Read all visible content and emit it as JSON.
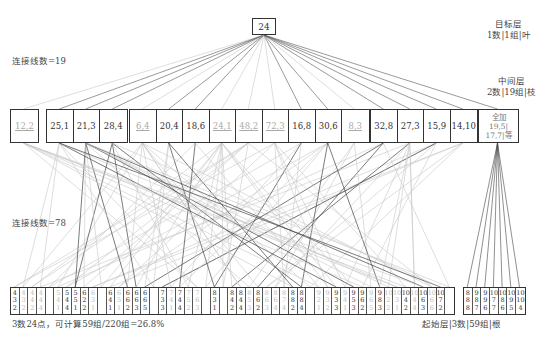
{
  "root": {
    "value": "24"
  },
  "labels": {
    "target_layer_title": "目标层",
    "target_layer_desc": "1数|1组|叶",
    "mid_layer_title": "中间层",
    "mid_layer_desc": "2数|19组|枝",
    "links_top": "连接线数=19",
    "links_bottom": "连接线数=78",
    "summary": "3数24点，可计算59组/220组=26.8%",
    "start_layer": "起始层|3数|59组|根"
  },
  "middle_groups": [
    {
      "left": 10,
      "cells": [
        {
          "text": "12,2",
          "faded": true
        }
      ]
    },
    {
      "left": 46,
      "cells": [
        {
          "text": "25,1"
        },
        {
          "text": "21,3"
        },
        {
          "text": "28,4"
        }
      ]
    },
    {
      "left": 129,
      "cells": [
        {
          "text": "6,4",
          "faded": true
        },
        {
          "text": "20,4"
        },
        {
          "text": "18,6"
        },
        {
          "text": "24,1",
          "faded": true
        },
        {
          "text": "48,2",
          "faded": true
        },
        {
          "text": "72,3",
          "faded": true
        },
        {
          "text": "16,8"
        },
        {
          "text": "30,6"
        },
        {
          "text": "8,3",
          "faded": true
        }
      ]
    },
    {
      "left": 370,
      "cells": [
        {
          "text": "32,8"
        },
        {
          "text": "27,3"
        },
        {
          "text": "15,9"
        },
        {
          "text": "14,10"
        }
      ]
    },
    {
      "left": 478,
      "cells": [
        {
          "note": true,
          "line1": "全加",
          "line2": "19,5|",
          "line3": "17,7|等"
        }
      ]
    }
  ],
  "bottom_cells": [
    {
      "d": [
        "4",
        "3",
        "2"
      ]
    },
    {
      "d": [
        "4",
        "3",
        "2"
      ],
      "faded": true
    },
    {
      "d": [
        "4",
        "4",
        "2"
      ],
      "faded": true
    },
    {
      "d": [
        "4",
        "4",
        "4"
      ],
      "faded": true
    },
    {
      "d": [
        "",
        "",
        ""
      ],
      "faded": true
    },
    {
      "d": [
        "5",
        "4",
        "1"
      ],
      "faded": true
    },
    {
      "d": [
        "5",
        "4",
        "4"
      ]
    },
    {
      "d": [
        "5",
        "5",
        "1"
      ]
    },
    {
      "d": [
        "6",
        "2",
        "2"
      ]
    },
    {
      "d": [
        "6",
        "3",
        "1"
      ],
      "faded": true
    },
    {
      "d": [
        "",
        "",
        ""
      ],
      "faded": true
    },
    {
      "d": [
        "6",
        "4",
        "1"
      ]
    },
    {
      "d": [
        "6",
        "5",
        "1"
      ],
      "faded": true
    },
    {
      "d": [
        "6",
        "6",
        "2"
      ]
    },
    {
      "d": [
        "6",
        "6",
        "3"
      ]
    },
    {
      "d": [
        "6",
        "6",
        "5"
      ]
    },
    {
      "d": [
        "",
        "",
        ""
      ],
      "faded": true
    },
    {
      "d": [
        "7",
        "3",
        "3"
      ]
    },
    {
      "d": [
        "7",
        "4",
        "1"
      ],
      "faded": true
    },
    {
      "d": [
        "7",
        "4",
        "4"
      ]
    },
    {
      "d": [
        "7",
        "5",
        "2"
      ],
      "faded": true
    },
    {
      "d": [
        "7",
        "6",
        "3"
      ],
      "faded": true
    },
    {
      "d": [
        "",
        "",
        ""
      ],
      "faded": true
    },
    {
      "d": [
        "8",
        "3",
        "1"
      ]
    },
    {
      "d": [
        "",
        "",
        ""
      ],
      "faded": true
    },
    {
      "d": [
        "8",
        "4",
        "2"
      ]
    },
    {
      "d": [
        "8",
        "4",
        "4"
      ]
    },
    {
      "d": [
        "8",
        "5",
        "3"
      ],
      "faded": true
    },
    {
      "d": [
        "8",
        "6",
        "2"
      ]
    },
    {
      "d": [
        "8",
        "6",
        "3"
      ],
      "faded": true
    },
    {
      "d": [
        "8",
        "6",
        "4"
      ],
      "faded": true
    },
    {
      "d": [
        "8",
        "7",
        "4"
      ],
      "faded": true
    },
    {
      "d": [
        "8",
        "8",
        "2"
      ]
    },
    {
      "d": [
        "8",
        "8",
        "4"
      ]
    },
    {
      "d": [
        "",
        "",
        ""
      ],
      "faded": true
    },
    {
      "d": [
        "9",
        "2",
        "1"
      ],
      "faded": true
    },
    {
      "d": [
        "9",
        "3",
        "2"
      ],
      "faded": true
    },
    {
      "d": [
        "9",
        "3",
        "3"
      ]
    },
    {
      "d": [
        "9",
        "4",
        "1"
      ],
      "faded": true
    },
    {
      "d": [
        "9",
        "5",
        "3"
      ]
    },
    {
      "d": [
        "9",
        "6",
        "2"
      ]
    },
    {
      "d": [
        "9",
        "6",
        "5"
      ],
      "faded": true
    },
    {
      "d": [
        "9",
        "8",
        "3"
      ]
    },
    {
      "d": [
        "10",
        "2",
        "2"
      ],
      "faded": true
    },
    {
      "d": [
        "10",
        "3",
        "1"
      ],
      "faded": true
    },
    {
      "d": [
        "10",
        "4",
        "2"
      ]
    },
    {
      "d": [
        "10",
        "4",
        "4"
      ],
      "faded": true
    },
    {
      "d": [
        "10",
        "6",
        "3"
      ]
    },
    {
      "d": [
        "10",
        "6",
        "6"
      ],
      "faded": true
    },
    {
      "d": [
        "10",
        "7",
        "2"
      ]
    },
    {
      "d": [
        "",
        "",
        ""
      ],
      "faded": true
    }
  ],
  "bottom_cells_right": [
    {
      "d": [
        "8",
        "8",
        "8"
      ]
    },
    {
      "d": [
        "9",
        "8",
        "7"
      ]
    },
    {
      "d": [
        "9",
        "9",
        "6"
      ]
    },
    {
      "d": [
        "10",
        "7",
        "7"
      ]
    },
    {
      "d": [
        "10",
        "8",
        "6"
      ]
    },
    {
      "d": [
        "10",
        "9",
        "5"
      ]
    },
    {
      "d": [
        "10",
        "10",
        "4"
      ]
    }
  ],
  "colors": {
    "line_dark": "#444444",
    "line_light": "#c8c8c8",
    "border": "#333333"
  }
}
